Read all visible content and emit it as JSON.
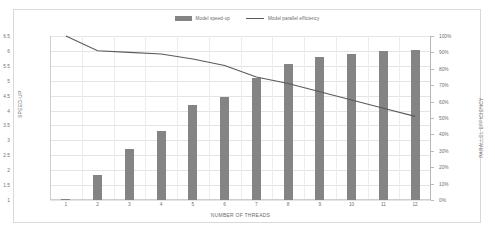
{
  "chart_data": {
    "type": "bar",
    "title": "",
    "subtitle": "",
    "xlabel": "NUMBER OF THREADS",
    "ylabel": "SPEED-UP",
    "y2label": "PARALLEL EFFICIENCY",
    "categories": [
      "1",
      "2",
      "3",
      "4",
      "5",
      "6",
      "7",
      "8",
      "9",
      "10",
      "11",
      "12"
    ],
    "x": [
      1,
      2,
      3,
      4,
      5,
      6,
      7,
      8,
      9,
      10,
      11,
      12
    ],
    "ylim": [
      1,
      6.5
    ],
    "y2lim": [
      0,
      100
    ],
    "yticks": [
      "6.5",
      "6",
      "5.5",
      "5",
      "4.5",
      "4",
      "3.5",
      "3",
      "2.5",
      "2",
      "1.5",
      "1"
    ],
    "ytick_values": [
      6.5,
      6,
      5.5,
      5,
      4.5,
      4,
      3.5,
      3,
      2.5,
      2,
      1.5,
      1
    ],
    "y2ticks": [
      "100%",
      "90%",
      "80%",
      "70%",
      "60%",
      "50%",
      "40%",
      "30%",
      "20%",
      "10%",
      "0%"
    ],
    "y2tick_values": [
      100,
      90,
      80,
      70,
      60,
      50,
      40,
      30,
      20,
      10,
      0
    ],
    "grid": true,
    "legend_position": "top-center",
    "series": [
      {
        "name": "Model speed-up",
        "type": "bar",
        "axis": "left",
        "color": "#848484",
        "values": [
          1.02,
          1.85,
          2.7,
          3.3,
          4.2,
          4.45,
          5.1,
          5.55,
          5.78,
          5.9,
          6.0,
          6.02
        ]
      },
      {
        "name": "Model parallel efficiency",
        "type": "line",
        "axis": "right",
        "color": "#5a5a5a",
        "values": [
          100,
          91,
          90,
          89,
          86,
          82,
          75,
          71,
          66,
          61,
          56,
          51
        ]
      }
    ]
  },
  "legend": {
    "entries": [
      {
        "label": "Model speed-up",
        "marker": "bar-swatch-icon"
      },
      {
        "label": "Model parallel efficiency",
        "marker": "line-swatch-icon"
      }
    ]
  }
}
